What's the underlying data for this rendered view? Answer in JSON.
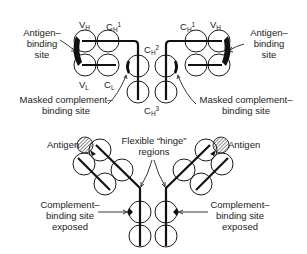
{
  "figure": {
    "top_panel": {
      "domain_labels": {
        "vh_left": "V",
        "vh_left_sub": "H",
        "ch1_left": "C",
        "ch1_left_sub": "H",
        "ch1_left_sup": "1",
        "ch2": "C",
        "ch2_sub": "H",
        "ch2_sup": "2",
        "ch1_right": "C",
        "ch1_right_sub": "H",
        "ch1_right_sup": "1",
        "vh_right": "V",
        "vh_right_sub": "H",
        "vl_left": "V",
        "vl_left_sub": "L",
        "cl_left": "C",
        "cl_left_sub": "L",
        "ch3": "C",
        "ch3_sub": "H",
        "ch3_sup": "3"
      },
      "antigen_binding_left": [
        "Antigen–",
        "binding",
        "site"
      ],
      "antigen_binding_right": [
        "Antigen–",
        "binding",
        "site"
      ],
      "masked_left": [
        "Masked complement–",
        "binding site"
      ],
      "masked_right": [
        "Masked complement–",
        "binding site"
      ]
    },
    "bottom_panel": {
      "antigen_left": "Antigen",
      "antigen_right": "Antigen",
      "hinge": [
        "Flexible “hinge”",
        "regions"
      ],
      "exposed_left": [
        "Complement–",
        "binding site",
        "exposed"
      ],
      "exposed_right": [
        "Complement–",
        "binding site",
        "exposed"
      ]
    },
    "colors": {
      "stroke": "#1a1a1a",
      "background": "#ffffff",
      "text": "#222222"
    }
  }
}
